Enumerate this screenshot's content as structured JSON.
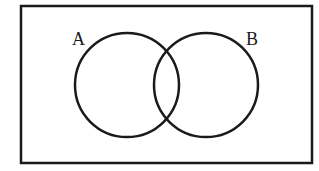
{
  "diagram": {
    "type": "venn",
    "universal_set": {
      "x": 21,
      "y": 6,
      "width": 291,
      "height": 157,
      "stroke": "#1a1a1a",
      "stroke_width": 2.5
    },
    "sets": [
      {
        "label": "A",
        "cx": 127,
        "cy": 85,
        "r": 52,
        "label_x": 72,
        "label_y": 45
      },
      {
        "label": "B",
        "cx": 206,
        "cy": 85,
        "r": 52,
        "label_x": 246,
        "label_y": 45
      }
    ],
    "stroke_color": "#1a1a1a",
    "background": "#ffffff"
  }
}
